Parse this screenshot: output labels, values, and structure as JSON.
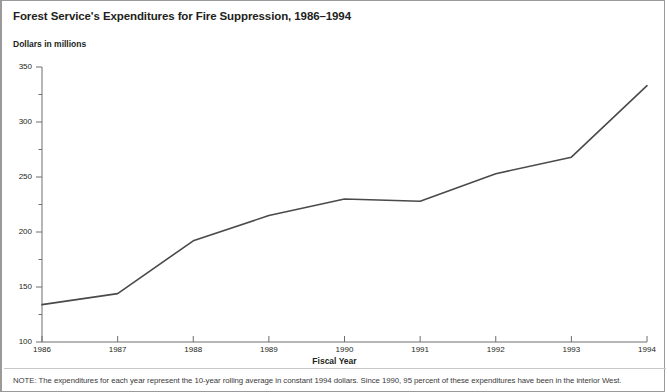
{
  "figure": {
    "title": "Forest Service's Expenditures for Fire Suppression, 1986–1994",
    "subtitle": "Dollars in millions",
    "note": "NOTE: The expenditures for each year represent the 10-year rolling average in constant 1994 dollars. Since 1990, 95 percent of these expenditures have been in the interior West.",
    "line_color": "#4a4a4a",
    "axis_color": "#6e6e6e"
  },
  "chart_data": {
    "type": "line",
    "title": "Forest Service's Expenditures for Fire Suppression, 1986–1994",
    "subtitle": "Dollars in millions",
    "xlabel": "Fiscal Year",
    "ylabel": "Dollars in millions",
    "categories": [
      "1986",
      "1987",
      "1988",
      "1989",
      "1990",
      "1991",
      "1992",
      "1993",
      "1994"
    ],
    "x": [
      1986,
      1987,
      1988,
      1989,
      1990,
      1991,
      1992,
      1993,
      1994
    ],
    "values": [
      134,
      144,
      192,
      215,
      230,
      228,
      253,
      268,
      333
    ],
    "series": [
      {
        "name": "Fire suppression expenditures",
        "values": [
          134,
          144,
          192,
          215,
          230,
          228,
          253,
          268,
          333
        ]
      }
    ],
    "ylim": [
      100,
      350
    ],
    "xlim": [
      1986,
      1994
    ],
    "ytick_labels": [
      "100",
      "150",
      "200",
      "250",
      "300",
      "350"
    ],
    "ytick_values": [
      100,
      150,
      200,
      250,
      300,
      350
    ],
    "yminor_values": [
      125,
      175,
      225,
      275,
      325
    ],
    "xtick_labels": [
      "1986",
      "1987",
      "1988",
      "1989",
      "1990",
      "1991",
      "1992",
      "1993",
      "1994"
    ],
    "grid": false,
    "legend": "none",
    "note": "NOTE: The expenditures for each year represent the 10-year rolling average in constant 1994 dollars. Since 1990, 95 percent of these expenditures have been in the interior West."
  }
}
